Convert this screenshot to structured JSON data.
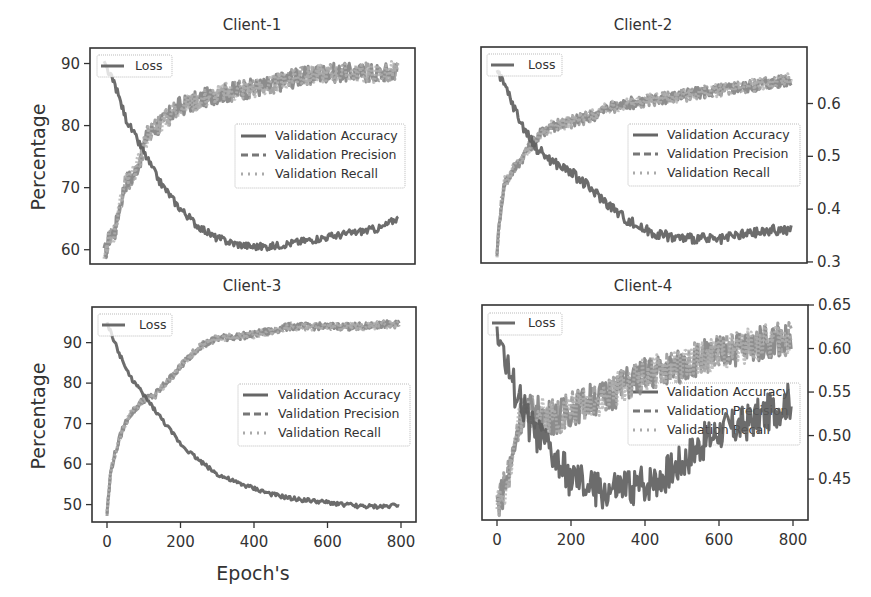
{
  "figure": {
    "width": 871,
    "height": 597,
    "shared_xlabel": "Epoch's",
    "shared_ylabel": "Percentage",
    "colors": {
      "metrics": "#8a8a8a",
      "loss": "#5a5a5a",
      "axes": "#333333",
      "legend_border": "#bbbbbb"
    }
  },
  "chart_data": [
    {
      "type": "line",
      "title": "Client-1",
      "xlabel": "",
      "ylabel": "Percentage",
      "xlim": [
        0,
        800
      ],
      "xticks": [
        0,
        200,
        400,
        600,
        800
      ],
      "show_xticks": false,
      "left_axis": {
        "ticks": [
          60,
          70,
          80,
          90
        ],
        "range": [
          57.7,
          92.5
        ]
      },
      "right_axis": null,
      "legend_upper_left": [
        "Loss"
      ],
      "legend_right": [
        "Validation Accuracy",
        "Validation Precision",
        "Validation Recall"
      ],
      "legend_right_pos": "center right",
      "grid": false,
      "series": [
        {
          "name": "Validation Accuracy",
          "axis": "left",
          "style": "solid",
          "noise": 1.6,
          "x": [
            0,
            15,
            30,
            45,
            60,
            80,
            100,
            120,
            150,
            200,
            250,
            300,
            350,
            400,
            450,
            500,
            550,
            600,
            650,
            700,
            750,
            790
          ],
          "y": [
            59,
            62,
            63,
            68,
            71,
            72,
            75,
            79,
            80,
            83,
            84,
            85,
            85.5,
            86,
            86.5,
            87.5,
            88,
            88.5,
            88.5,
            88.5,
            88.5,
            89
          ]
        },
        {
          "name": "Validation Precision",
          "axis": "left",
          "style": "dashed",
          "noise": 1.6,
          "x": [
            0,
            15,
            30,
            45,
            60,
            80,
            100,
            120,
            150,
            200,
            250,
            300,
            350,
            400,
            450,
            500,
            550,
            600,
            650,
            700,
            750,
            790
          ],
          "y": [
            59,
            62,
            63,
            68,
            71,
            72,
            75,
            79,
            80,
            83,
            84,
            85,
            85.5,
            86,
            86.5,
            87.5,
            88,
            88.5,
            88.5,
            88.5,
            88.5,
            89
          ]
        },
        {
          "name": "Validation Recall",
          "axis": "left",
          "style": "dotted",
          "noise": 1.6,
          "x": [
            0,
            15,
            30,
            45,
            60,
            80,
            100,
            120,
            150,
            200,
            250,
            300,
            350,
            400,
            450,
            500,
            550,
            600,
            650,
            700,
            750,
            790
          ],
          "y": [
            59,
            62,
            63,
            68,
            71,
            72,
            75,
            79,
            80,
            83,
            84,
            85,
            85.5,
            86,
            86.5,
            87.5,
            88,
            88.5,
            88.5,
            88.5,
            88.5,
            89
          ]
        },
        {
          "name": "Loss",
          "axis": "left",
          "style": "solid-dark",
          "noise": 0.6,
          "x": [
            0,
            30,
            60,
            100,
            150,
            200,
            250,
            300,
            350,
            400,
            450,
            500,
            550,
            600,
            650,
            700,
            750,
            790
          ],
          "y": [
            90,
            86.5,
            81,
            76.5,
            71,
            67,
            64,
            62,
            61,
            60.5,
            60.5,
            61,
            61.5,
            62,
            62.5,
            63,
            63.5,
            65
          ]
        }
      ]
    },
    {
      "type": "line",
      "title": "Client-2",
      "xlabel": "",
      "ylabel": "",
      "xlim": [
        0,
        800
      ],
      "xticks": [
        0,
        200,
        400,
        600,
        800
      ],
      "show_xticks": false,
      "left_axis": {
        "ticks": [],
        "range": [
          0,
          1
        ]
      },
      "right_axis": {
        "ticks": [
          0.3,
          0.4,
          0.5,
          0.6
        ],
        "tick_labels": [
          "0.3",
          "0.4",
          "0.5",
          "0.6"
        ],
        "range": [
          0.298,
          0.707
        ]
      },
      "legend_upper_left": [
        "Loss"
      ],
      "legend_right": [
        "Validation Accuracy",
        "Validation Precision",
        "Validation Recall"
      ],
      "legend_right_pos": "center right",
      "grid": false,
      "series": [
        {
          "name": "Validation Accuracy",
          "axis": "right",
          "style": "solid",
          "noise": 0.012,
          "x": [
            0,
            10,
            20,
            40,
            60,
            80,
            100,
            130,
            160,
            200,
            250,
            300,
            350,
            400,
            450,
            500,
            550,
            600,
            650,
            700,
            750,
            790
          ],
          "y": [
            0.32,
            0.4,
            0.45,
            0.47,
            0.49,
            0.51,
            0.53,
            0.55,
            0.56,
            0.565,
            0.575,
            0.59,
            0.6,
            0.605,
            0.61,
            0.615,
            0.62,
            0.625,
            0.63,
            0.635,
            0.64,
            0.645
          ]
        },
        {
          "name": "Validation Precision",
          "axis": "right",
          "style": "dashed",
          "noise": 0.012,
          "x": [
            0,
            10,
            20,
            40,
            60,
            80,
            100,
            130,
            160,
            200,
            250,
            300,
            350,
            400,
            450,
            500,
            550,
            600,
            650,
            700,
            750,
            790
          ],
          "y": [
            0.32,
            0.4,
            0.45,
            0.47,
            0.49,
            0.51,
            0.53,
            0.55,
            0.56,
            0.565,
            0.575,
            0.59,
            0.6,
            0.605,
            0.61,
            0.615,
            0.62,
            0.625,
            0.63,
            0.635,
            0.64,
            0.645
          ]
        },
        {
          "name": "Validation Recall",
          "axis": "right",
          "style": "dotted",
          "noise": 0.012,
          "x": [
            0,
            10,
            20,
            40,
            60,
            80,
            100,
            130,
            160,
            200,
            250,
            300,
            350,
            400,
            450,
            500,
            550,
            600,
            650,
            700,
            750,
            790
          ],
          "y": [
            0.32,
            0.4,
            0.45,
            0.47,
            0.49,
            0.51,
            0.53,
            0.55,
            0.56,
            0.565,
            0.575,
            0.59,
            0.6,
            0.605,
            0.61,
            0.615,
            0.62,
            0.625,
            0.63,
            0.635,
            0.64,
            0.645
          ]
        },
        {
          "name": "Loss",
          "axis": "right",
          "style": "solid-dark",
          "noise": 0.01,
          "x": [
            0,
            30,
            60,
            100,
            150,
            200,
            250,
            300,
            350,
            400,
            450,
            500,
            550,
            600,
            650,
            700,
            750,
            790
          ],
          "y": [
            0.66,
            0.62,
            0.57,
            0.52,
            0.49,
            0.47,
            0.44,
            0.41,
            0.38,
            0.36,
            0.35,
            0.345,
            0.345,
            0.34,
            0.35,
            0.355,
            0.36,
            0.36
          ]
        }
      ]
    },
    {
      "type": "line",
      "title": "Client-3",
      "xlabel": "Epoch's",
      "ylabel": "Percentage",
      "xlim": [
        0,
        800
      ],
      "xticks": [
        0,
        200,
        400,
        600,
        800
      ],
      "show_xticks": true,
      "left_axis": {
        "ticks": [
          50,
          60,
          70,
          80,
          90
        ],
        "range": [
          45.7,
          98.8
        ]
      },
      "right_axis": null,
      "legend_upper_left": [
        "Loss"
      ],
      "legend_right": [
        "Validation Accuracy",
        "Validation Precision",
        "Validation Recall"
      ],
      "legend_right_pos": "center right",
      "grid": false,
      "series": [
        {
          "name": "Validation Accuracy",
          "axis": "left",
          "style": "solid",
          "noise": 0.9,
          "x": [
            0,
            10,
            20,
            40,
            60,
            80,
            100,
            130,
            160,
            200,
            250,
            300,
            350,
            400,
            450,
            500,
            550,
            600,
            650,
            700,
            750,
            790
          ],
          "y": [
            48,
            58,
            62,
            68,
            72,
            74,
            76,
            77,
            80,
            84,
            89,
            91,
            91.5,
            92,
            93,
            94,
            94,
            94,
            94,
            94,
            94.5,
            94.5
          ]
        },
        {
          "name": "Validation Precision",
          "axis": "left",
          "style": "dashed",
          "noise": 0.9,
          "x": [
            0,
            10,
            20,
            40,
            60,
            80,
            100,
            130,
            160,
            200,
            250,
            300,
            350,
            400,
            450,
            500,
            550,
            600,
            650,
            700,
            750,
            790
          ],
          "y": [
            48,
            58,
            62,
            68,
            72,
            74,
            76,
            77,
            80,
            84,
            89,
            91,
            91.5,
            92,
            93,
            94,
            94,
            94,
            94,
            94,
            94.5,
            94.5
          ]
        },
        {
          "name": "Validation Recall",
          "axis": "left",
          "style": "dotted",
          "noise": 0.9,
          "x": [
            0,
            10,
            20,
            40,
            60,
            80,
            100,
            130,
            160,
            200,
            250,
            300,
            350,
            400,
            450,
            500,
            550,
            600,
            650,
            700,
            750,
            790
          ],
          "y": [
            48,
            58,
            62,
            68,
            72,
            74,
            76,
            77,
            80,
            84,
            89,
            91,
            91.5,
            92,
            93,
            94,
            94,
            94,
            94,
            94,
            94.5,
            94.5
          ]
        },
        {
          "name": "Loss",
          "axis": "left",
          "style": "solid-dark",
          "noise": 0.5,
          "x": [
            0,
            30,
            60,
            100,
            150,
            200,
            250,
            300,
            350,
            400,
            450,
            500,
            550,
            600,
            650,
            700,
            750,
            790
          ],
          "y": [
            95,
            88,
            82,
            77,
            71,
            65,
            61,
            57.5,
            55.5,
            54,
            52.5,
            51.5,
            51,
            50.5,
            50,
            49.5,
            49.5,
            50
          ]
        }
      ]
    },
    {
      "type": "line",
      "title": "Client-4",
      "xlabel": "",
      "ylabel": "",
      "xlim": [
        0,
        800
      ],
      "xticks": [
        0,
        200,
        400,
        600,
        800
      ],
      "show_xticks": true,
      "left_axis": {
        "ticks": [],
        "range": [
          0,
          1
        ]
      },
      "right_axis": {
        "ticks": [
          0.45,
          0.5,
          0.55,
          0.6,
          0.65
        ],
        "tick_labels": [
          "0.45",
          "0.50",
          "0.55",
          "0.60",
          "0.65"
        ],
        "range": [
          0.403,
          0.65
        ]
      },
      "legend_upper_left": [
        "Loss"
      ],
      "legend_right": [
        "Validation Accuracy",
        "Validation Precision",
        "Validation Recall"
      ],
      "legend_right_pos": "center right",
      "grid": false,
      "series": [
        {
          "name": "Validation Accuracy",
          "axis": "right",
          "style": "solid",
          "noise": 0.02,
          "x": [
            0,
            20,
            40,
            60,
            80,
            120,
            160,
            200,
            250,
            300,
            350,
            400,
            450,
            500,
            550,
            600,
            650,
            700,
            750,
            790
          ],
          "y": [
            0.42,
            0.44,
            0.47,
            0.52,
            0.53,
            0.525,
            0.52,
            0.53,
            0.54,
            0.545,
            0.56,
            0.57,
            0.575,
            0.58,
            0.59,
            0.595,
            0.6,
            0.605,
            0.61,
            0.61
          ]
        },
        {
          "name": "Validation Precision",
          "axis": "right",
          "style": "dashed",
          "noise": 0.02,
          "x": [
            0,
            20,
            40,
            60,
            80,
            120,
            160,
            200,
            250,
            300,
            350,
            400,
            450,
            500,
            550,
            600,
            650,
            700,
            750,
            790
          ],
          "y": [
            0.42,
            0.44,
            0.47,
            0.52,
            0.53,
            0.525,
            0.52,
            0.53,
            0.54,
            0.545,
            0.56,
            0.57,
            0.575,
            0.58,
            0.59,
            0.595,
            0.6,
            0.605,
            0.61,
            0.61
          ]
        },
        {
          "name": "Validation Recall",
          "axis": "right",
          "style": "dotted",
          "noise": 0.02,
          "x": [
            0,
            20,
            40,
            60,
            80,
            120,
            160,
            200,
            250,
            300,
            350,
            400,
            450,
            500,
            550,
            600,
            650,
            700,
            750,
            790
          ],
          "y": [
            0.42,
            0.44,
            0.47,
            0.52,
            0.53,
            0.525,
            0.52,
            0.53,
            0.54,
            0.545,
            0.56,
            0.57,
            0.575,
            0.58,
            0.59,
            0.595,
            0.6,
            0.605,
            0.61,
            0.61
          ]
        },
        {
          "name": "Loss",
          "axis": "right",
          "style": "solid-dark",
          "noise": 0.022,
          "x": [
            0,
            10,
            20,
            40,
            60,
            80,
            100,
            130,
            160,
            200,
            250,
            300,
            350,
            400,
            450,
            500,
            550,
            600,
            650,
            700,
            750,
            790
          ],
          "y": [
            0.63,
            0.61,
            0.59,
            0.56,
            0.545,
            0.52,
            0.505,
            0.49,
            0.47,
            0.45,
            0.44,
            0.435,
            0.44,
            0.445,
            0.455,
            0.47,
            0.49,
            0.505,
            0.51,
            0.52,
            0.53,
            0.54
          ]
        }
      ]
    }
  ],
  "panels_layout": [
    {
      "plot": {
        "left": 90,
        "top": 48,
        "right": 415,
        "bottom": 264
      },
      "x0": 104,
      "x800": 400,
      "left_ticks_px": {
        "60": 247,
        "90": 64
      },
      "title_y": 30
    },
    {
      "plot": {
        "left": 481,
        "top": 47,
        "right": 807,
        "bottom": 263
      },
      "x0": 497,
      "x800": 793,
      "right_ticks_px": {
        "0.3": 260,
        "0.6": 100
      },
      "title_y": 30
    },
    {
      "plot": {
        "left": 92,
        "top": 307,
        "right": 416,
        "bottom": 522
      },
      "x0": 107,
      "x800": 401,
      "left_ticks_px": {
        "50": 503,
        "90": 341
      },
      "title_y": 290
    },
    {
      "plot": {
        "left": 482,
        "top": 305,
        "right": 808,
        "bottom": 520
      },
      "x0": 497,
      "x800": 793,
      "right_ticks_px": {
        "0.45": 479,
        "0.65": 305
      },
      "title_y": 290
    }
  ]
}
